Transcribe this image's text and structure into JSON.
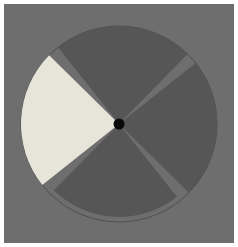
{
  "figure": {
    "title": "Four-sector disc with one highlighted light sector",
    "canvas": {
      "width": 238,
      "height": 247,
      "border_color": "#ffffff",
      "border_width": 4,
      "background_color": "#6e6e6e"
    },
    "disc": {
      "center_x": 119,
      "center_y": 124,
      "radius": 98,
      "gap_degrees": 7,
      "gap_color": "#6e6e6e"
    },
    "hub": {
      "label": "center-hub",
      "center_x": 119,
      "center_y": 124,
      "radius": 5.5,
      "color": "#0a0a0a"
    },
    "colors": {
      "background": "#6e6e6e",
      "sector_dark": "#565656",
      "sector_light": "#e7e4da",
      "hub": "#0a0a0a",
      "outline": "#4e4e4e"
    }
  },
  "chart_data": {
    "type": "pie",
    "title": "Four-sector disc with one highlighted light sector",
    "categories": [
      "top-sector",
      "right-sector",
      "bottom-sector",
      "left-sector"
    ],
    "values": [
      25,
      25,
      25,
      25
    ],
    "units": "percent",
    "labels_shown": false,
    "legend": "none",
    "grid": false,
    "slices": [
      {
        "name": "top-sector",
        "value": 25,
        "start_angle_deg": 228,
        "end_angle_deg": 318,
        "color": "#565656",
        "radius": 98,
        "highlighted": false
      },
      {
        "name": "right-sector",
        "value": 25,
        "start_angle_deg": 318,
        "end_angle_deg": 48,
        "color": "#565656",
        "radius": 98,
        "highlighted": false
      },
      {
        "name": "bottom-sector",
        "value": 25,
        "start_angle_deg": 48,
        "end_angle_deg": 138,
        "color": "#565656",
        "radius": 93,
        "highlighted": false
      },
      {
        "name": "left-sector",
        "value": 25,
        "start_angle_deg": 138,
        "end_angle_deg": 228,
        "color": "#e7e4da",
        "radius": 98,
        "highlighted": true
      }
    ]
  }
}
